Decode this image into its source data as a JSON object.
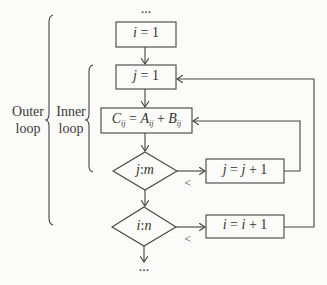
{
  "diagram": {
    "type": "flowchart",
    "start_ellipsis": "...",
    "end_ellipsis": "...",
    "braces": [
      {
        "id": "outer",
        "label_line1": "Outer",
        "label_line2": "loop"
      },
      {
        "id": "inner",
        "label_line1": "Inner",
        "label_line2": "loop"
      }
    ],
    "nodes": [
      {
        "id": "init_i",
        "shape": "rect",
        "var": "i",
        "op": "=",
        "value": "1"
      },
      {
        "id": "init_j",
        "shape": "rect",
        "var": "j",
        "op": "=",
        "value": "1"
      },
      {
        "id": "compute",
        "shape": "rect",
        "lhs": "C",
        "lhs_sub": "ij",
        "eq": "=",
        "a": "A",
        "a_sub": "ij",
        "plus": "+",
        "b": "B",
        "b_sub": "ij"
      },
      {
        "id": "test_j",
        "shape": "diamond",
        "left": "j",
        "sep": ":",
        "right": "m"
      },
      {
        "id": "inc_j",
        "shape": "rect",
        "var": "j",
        "op": "=",
        "rhs": "j",
        "plus": "+",
        "value": "1"
      },
      {
        "id": "test_i",
        "shape": "diamond",
        "left": "i",
        "sep": ":",
        "right": "n"
      },
      {
        "id": "inc_i",
        "shape": "rect",
        "var": "i",
        "op": "=",
        "rhs": "i",
        "plus": "+",
        "value": "1"
      }
    ],
    "edge_labels": {
      "test_j_less": "<",
      "test_i_less": "<"
    },
    "edges": [
      {
        "from": "init_i",
        "to": "init_j"
      },
      {
        "from": "init_j",
        "to": "compute"
      },
      {
        "from": "compute",
        "to": "test_j"
      },
      {
        "from": "test_j",
        "to": "inc_j",
        "label": "<"
      },
      {
        "from": "inc_j",
        "to": "compute"
      },
      {
        "from": "test_j",
        "to": "test_i"
      },
      {
        "from": "test_i",
        "to": "inc_i",
        "label": "<"
      },
      {
        "from": "inc_i",
        "to": "init_j"
      }
    ]
  }
}
